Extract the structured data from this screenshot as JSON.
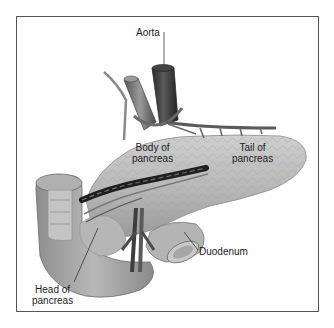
{
  "figure": {
    "labels": {
      "aorta": "Aorta",
      "body_line1": "Body of",
      "body_line2": "pancreas",
      "tail_line1": "Tail of",
      "tail_line2": "pancreas",
      "duodenum": "Duodenum",
      "head_line1": "Head of",
      "head_line2": "pancreas"
    },
    "colors": {
      "frame": "#555555",
      "pancreas_tissue": "#bdbdbd",
      "vessel_dark": "#3a3a3a",
      "intestine": "#a8a8a8",
      "label_text": "#222222"
    }
  }
}
